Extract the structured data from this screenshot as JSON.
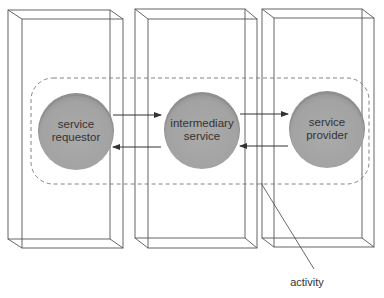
{
  "diagram": {
    "title": "",
    "boxes": [
      {
        "id": "box-requestor"
      },
      {
        "id": "box-intermediary"
      },
      {
        "id": "box-provider"
      }
    ],
    "nodes": [
      {
        "id": "service-requestor",
        "line1": "service",
        "line2": "requestor"
      },
      {
        "id": "intermediary-service",
        "line1": "intermediary",
        "line2": "service"
      },
      {
        "id": "service-provider",
        "line1": "service",
        "line2": "provider"
      }
    ],
    "arrows": [
      {
        "from": "service-requestor",
        "to": "intermediary-service"
      },
      {
        "from": "intermediary-service",
        "to": "service-requestor"
      },
      {
        "from": "intermediary-service",
        "to": "service-provider"
      },
      {
        "from": "service-provider",
        "to": "intermediary-service"
      }
    ],
    "activity_region": {
      "label": "activity"
    },
    "colors": {
      "node_fill": "#a6a6a6",
      "node_shadow": "#8c8c8c",
      "box_edge": "#555555",
      "dash": "#777777",
      "text": "#333333"
    }
  }
}
